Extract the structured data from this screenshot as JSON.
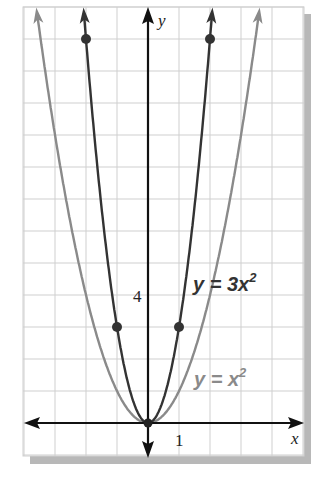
{
  "chart_data": {
    "type": "line",
    "title": "",
    "xlabel": "x",
    "ylabel": "y",
    "xlim": [
      -4,
      5
    ],
    "ylim": [
      -1,
      13
    ],
    "grid": true,
    "tick_labels": {
      "x": [
        "1"
      ],
      "y": [
        "4"
      ]
    },
    "series": [
      {
        "name": "y = 3x^2",
        "label": "y = 3x",
        "label_exp": "2",
        "color": "#333333",
        "points": [
          [
            -2,
            12
          ],
          [
            -1,
            3
          ],
          [
            0,
            0
          ],
          [
            1,
            3
          ],
          [
            2,
            12
          ]
        ]
      },
      {
        "name": "y = x^2",
        "label": "y = x",
        "label_exp": "2",
        "color": "#888888",
        "points": [
          [
            -3.6,
            13
          ],
          [
            0,
            0
          ],
          [
            3.6,
            13
          ]
        ]
      }
    ]
  },
  "axes": {
    "x_label": "x",
    "y_label": "y",
    "x_tick": "1",
    "y_tick": "4"
  }
}
